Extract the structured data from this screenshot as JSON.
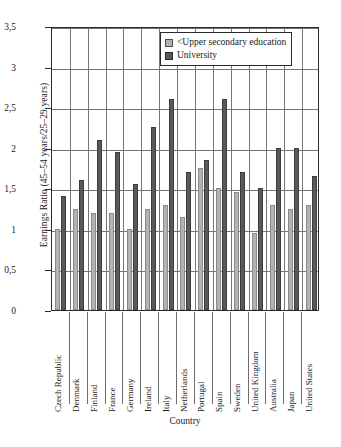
{
  "chart_data": {
    "type": "bar",
    "title": "",
    "xlabel": "Country",
    "ylabel": "Earnings Ratio (45–54 years/25–29 years)",
    "ylim": [
      0,
      3.5
    ],
    "ytick_labels": [
      "0",
      "0,5",
      "1",
      "1,5",
      "2",
      "2,5",
      "3",
      "3,5"
    ],
    "ytick_values": [
      0,
      0.5,
      1,
      1.5,
      2,
      2.5,
      3,
      3.5
    ],
    "grid": true,
    "legend_position": "top-right",
    "categories": [
      "Czech Republic",
      "Denmark",
      "Finland",
      "France",
      "Germany",
      "Ireland",
      "Italy",
      "Netherlands",
      "Portugal",
      "Spain",
      "Sweden",
      "United Kingdom",
      "Australia",
      "Japan",
      "United States"
    ],
    "series": [
      {
        "name": "<Upper secondary education",
        "color": "#b3b3b3",
        "values": [
          1.0,
          1.25,
          1.2,
          1.2,
          1.0,
          1.25,
          1.3,
          1.15,
          1.75,
          1.5,
          1.45,
          0.95,
          1.3,
          1.25,
          1.3
        ]
      },
      {
        "name": "University",
        "color": "#595959",
        "values": [
          1.4,
          1.6,
          2.1,
          1.95,
          1.55,
          2.25,
          2.6,
          1.7,
          1.85,
          2.6,
          1.7,
          1.5,
          2.0,
          2.0,
          1.65
        ]
      }
    ]
  },
  "legend": {
    "items": [
      {
        "label": "<Upper secondary education",
        "swatch": "light"
      },
      {
        "label": "University",
        "swatch": "dark"
      }
    ]
  }
}
